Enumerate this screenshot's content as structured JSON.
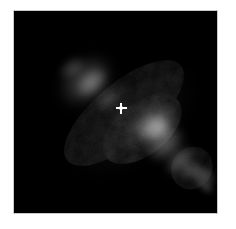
{
  "figure": {
    "kind": "astronomical-image",
    "caption": "",
    "background_color": "#000000",
    "page_color": "#ffffff",
    "border_color": "#c9c9c9",
    "plate": {
      "x": 13,
      "y": 10,
      "width": 205,
      "height": 204
    }
  },
  "marker": {
    "name": "crosshair",
    "label": "+",
    "color": "#ffffff",
    "x": 120,
    "y": 107,
    "size": 11
  },
  "chart_data": {
    "type": "heatmap",
    "title": "",
    "subtitle": "",
    "xlabel": "",
    "ylabel": "",
    "grid": false,
    "legend": "none",
    "colormap": "grayscale",
    "value_range": [
      0,
      1
    ],
    "axis_units": "pixels",
    "xlim": [
      0,
      205
    ],
    "ylim": [
      0,
      204
    ],
    "features": [
      {
        "name": "north-west-lobe",
        "cx": 72,
        "cy": 70,
        "rx": 28,
        "ry": 19,
        "angle": -42,
        "peak": 0.3
      },
      {
        "name": "north-west-lobe-core",
        "cx": 78,
        "cy": 72,
        "rx": 17,
        "ry": 11,
        "angle": -42,
        "peak": 0.34
      },
      {
        "name": "north-west-lobe-tip",
        "cx": 58,
        "cy": 57,
        "rx": 14,
        "ry": 9,
        "angle": -35,
        "peak": 0.2
      },
      {
        "name": "inner-bridge-nw",
        "cx": 95,
        "cy": 88,
        "rx": 16,
        "ry": 9,
        "angle": -40,
        "peak": 0.22
      },
      {
        "name": "waist-gap",
        "cx": 114,
        "cy": 101,
        "rx": 8,
        "ry": 6,
        "angle": -40,
        "peak": 0.05
      },
      {
        "name": "south-east-lobe-head",
        "cx": 139,
        "cy": 113,
        "rx": 24,
        "ry": 15,
        "angle": -30,
        "peak": 0.42
      },
      {
        "name": "south-east-lobe-core",
        "cx": 143,
        "cy": 118,
        "rx": 16,
        "ry": 12,
        "angle": -30,
        "peak": 0.46
      },
      {
        "name": "south-east-lobe-mid",
        "cx": 152,
        "cy": 133,
        "rx": 20,
        "ry": 13,
        "angle": -42,
        "peak": 0.38
      },
      {
        "name": "south-east-lobe-tail",
        "cx": 166,
        "cy": 150,
        "rx": 17,
        "ry": 11,
        "angle": -45,
        "peak": 0.3
      },
      {
        "name": "south-east-extension",
        "cx": 177,
        "cy": 159,
        "rx": 12,
        "ry": 8,
        "angle": -45,
        "peak": 0.22
      },
      {
        "name": "detached-knot",
        "cx": 189,
        "cy": 166,
        "rx": 11,
        "ry": 13,
        "angle": -60,
        "peak": 0.26
      },
      {
        "name": "detached-knot-tip",
        "cx": 193,
        "cy": 177,
        "rx": 6,
        "ry": 8,
        "angle": -60,
        "peak": 0.16
      },
      {
        "name": "halo-diffuse",
        "cx": 120,
        "cy": 112,
        "rx": 70,
        "ry": 30,
        "angle": -40,
        "peak": 0.07
      }
    ]
  }
}
